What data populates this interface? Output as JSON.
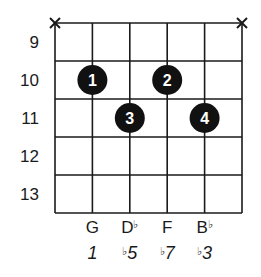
{
  "diagram": {
    "type": "guitar-chord-chart",
    "strings": 6,
    "frets_shown": [
      9,
      10,
      11,
      12,
      13
    ],
    "muted_strings": [
      1,
      6
    ],
    "mute_symbol": "X",
    "fingers": [
      {
        "finger": "1",
        "string": 2,
        "fret": 10
      },
      {
        "finger": "2",
        "string": 4,
        "fret": 10
      },
      {
        "finger": "3",
        "string": 3,
        "fret": 11
      },
      {
        "finger": "4",
        "string": 5,
        "fret": 11
      }
    ],
    "note_names": [
      {
        "string": 2,
        "note": "G",
        "accidental": ""
      },
      {
        "string": 3,
        "note": "D",
        "accidental": "♭"
      },
      {
        "string": 4,
        "note": "F",
        "accidental": ""
      },
      {
        "string": 5,
        "note": "B",
        "accidental": "♭"
      }
    ],
    "intervals": [
      {
        "string": 2,
        "accidental": "",
        "degree": "1"
      },
      {
        "string": 3,
        "accidental": "♭",
        "degree": "5"
      },
      {
        "string": 4,
        "accidental": "♭",
        "degree": "7"
      },
      {
        "string": 5,
        "accidental": "♭",
        "degree": "3"
      }
    ],
    "colors": {
      "line": "#1a1a1a",
      "dot": "#111111",
      "dot_text": "#ffffff",
      "background": "#ffffff"
    }
  }
}
